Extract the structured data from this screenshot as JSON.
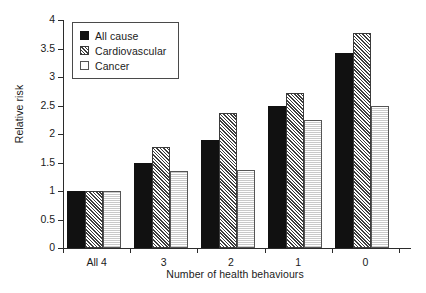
{
  "chart_data": {
    "type": "bar",
    "title": "",
    "xlabel": "Number of health behaviours",
    "ylabel": "Relative risk",
    "categories": [
      "All 4",
      "3",
      "2",
      "1",
      "0"
    ],
    "series": [
      {
        "name": "All cause",
        "values": [
          1.0,
          1.5,
          1.9,
          2.5,
          3.42
        ]
      },
      {
        "name": "Cardiovascular",
        "values": [
          1.0,
          1.77,
          2.37,
          2.72,
          3.78
        ]
      },
      {
        "name": "Cancer",
        "values": [
          1.0,
          1.35,
          1.37,
          2.24,
          2.5
        ]
      }
    ],
    "ylim": [
      0,
      4
    ],
    "yticks": [
      "0",
      "0.5",
      "1",
      "1.5",
      "2",
      "2.5",
      "3",
      "3.5",
      "4"
    ],
    "ytick_values": [
      0,
      0.5,
      1,
      1.5,
      2,
      2.5,
      3,
      3.5,
      4
    ],
    "grid": false,
    "legend_position": "upper left"
  },
  "legend": {
    "entries": [
      {
        "label": "All cause",
        "pattern": "solid-black"
      },
      {
        "label": "Cardiovascular",
        "pattern": "diagonal-hatch"
      },
      {
        "label": "Cancer",
        "pattern": "fine-dot-light"
      }
    ]
  },
  "colors": {
    "all_cause": "#111111",
    "cardiovascular": "#3d3d3d",
    "cancer": "#c9c9c9",
    "axis": "#2b2b2b",
    "background": "#ffffff"
  }
}
